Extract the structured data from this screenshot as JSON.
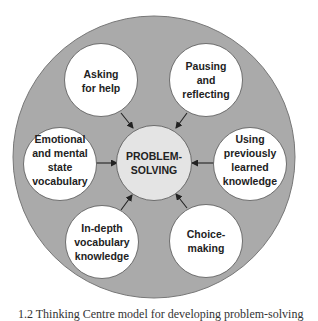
{
  "diagram": {
    "title": "Thinking Centre model",
    "colors": {
      "outer_ring": "#aaaaaa",
      "outer_stroke": "#777777",
      "node_fill": "#ffffff",
      "center_fill": "#e4e4e4",
      "node_stroke": "#555555",
      "arrow": "#222222",
      "text": "#222222"
    },
    "center": {
      "lines": [
        "PROBLEM-",
        "SOLVING"
      ]
    },
    "nodes": [
      {
        "id": "asking-for-help",
        "lines": [
          "Asking",
          "for help"
        ]
      },
      {
        "id": "pausing-and-reflecting",
        "lines": [
          "Pausing",
          "and",
          "reflecting"
        ]
      },
      {
        "id": "using-previously-learned-knowledge",
        "lines": [
          "Using",
          "previously",
          "learned",
          "knowledge"
        ]
      },
      {
        "id": "choice-making",
        "lines": [
          "Choice-",
          "making"
        ]
      },
      {
        "id": "in-depth-vocabulary-knowledge",
        "lines": [
          "In-depth",
          "vocabulary",
          "knowledge"
        ]
      },
      {
        "id": "emotional-and-mental-state-vocabulary",
        "lines": [
          "Emotional",
          "and mental",
          "state",
          "vocabulary"
        ]
      }
    ],
    "edges": [
      {
        "from": "asking-for-help",
        "to": "center"
      },
      {
        "from": "pausing-and-reflecting",
        "to": "center"
      },
      {
        "from": "using-previously-learned-knowledge",
        "to": "center"
      },
      {
        "from": "choice-making",
        "to": "center"
      },
      {
        "from": "in-depth-vocabulary-knowledge",
        "to": "center"
      },
      {
        "from": "emotional-and-mental-state-vocabulary",
        "to": "center"
      }
    ]
  },
  "caption": {
    "text": "1.2 Thinking Centre model for developing problem-solving"
  }
}
